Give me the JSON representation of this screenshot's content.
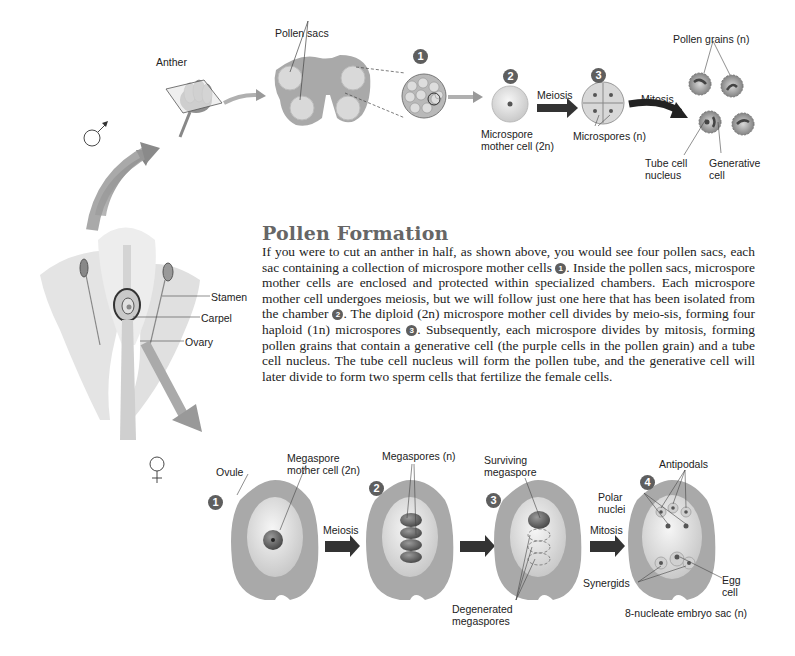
{
  "male_section": {
    "symbol": "♂",
    "labels": {
      "anther": "Anther",
      "pollen_sacs": "Pollen sacs",
      "meiosis": "Meiosis",
      "mitosis": "Mitosis",
      "microspore_mother_cell_line1": "Microspore",
      "microspore_mother_cell_line2": "mother cell (2n)",
      "microspores": "Microspores (n)",
      "pollen_grains": "Pollen grains (n)",
      "tube_cell_line1": "Tube cell",
      "tube_cell_line2": "nucleus",
      "generative_line1": "Generative",
      "generative_line2": "cell"
    },
    "step_numbers": [
      "1",
      "2",
      "3"
    ]
  },
  "flower": {
    "labels": {
      "stamen": "Stamen",
      "carpel": "Carpel",
      "ovary": "Ovary"
    }
  },
  "article": {
    "heading": "Pollen Formation",
    "paragraph_parts": [
      "If you were to cut an anther in half, as shown above, you would see four pollen sacs, each sac containing a collection of microspore mother cells ",
      "1",
      ". Inside the pollen sacs, microspore mother cells are enclosed and protected within specialized chambers. Each microspore mother cell undergoes meiosis, but we will follow just one here that has been isolated from the chamber ",
      "2",
      ". The diploid (2n) microspore mother cell divides by meio-sis, forming four haploid (1n) microspores ",
      "3",
      ". Subsequently, each microspore divides by mitosis, forming pollen grains that contain a generative cell (the purple cells in the pollen grain) and a tube cell nucleus. The tube cell nucleus will form the pollen tube, and the generative cell will later divide to form two sperm cells that fertilize the female cells."
    ]
  },
  "female_section": {
    "symbol": "♀",
    "labels": {
      "ovule": "Ovule",
      "megaspore_mother_cell_line1": "Megaspore",
      "megaspore_mother_cell_line2": "mother cell (2n)",
      "meiosis": "Meiosis",
      "megaspores": "Megaspores (n)",
      "surviving_line1": "Surviving",
      "surviving_line2": "megaspore",
      "degenerated_line1": "Degenerated",
      "degenerated_line2": "megaspores",
      "mitosis": "Mitosis",
      "antipodals": "Antipodals",
      "polar_line1": "Polar",
      "polar_line2": "nuclei",
      "synergids": "Synergids",
      "egg_line1": "Egg",
      "egg_line2": "cell",
      "embryo_sac": "8-nucleate embryo sac (n)"
    },
    "step_numbers": [
      "1",
      "2",
      "3",
      "4"
    ]
  }
}
